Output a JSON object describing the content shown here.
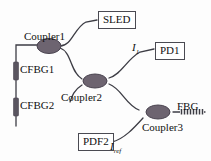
{
  "diagram": {
    "background_color": "#fdfdfd",
    "line_color": "#3d3d45",
    "coupler_fill": "#6d6470",
    "coupler_stroke": "#4a4450",
    "grating_color": "#5a5560"
  },
  "couplers": [
    {
      "id": "coupler1",
      "label": "Coupler1"
    },
    {
      "id": "coupler2",
      "label": "Coupler2"
    },
    {
      "id": "coupler3",
      "label": "Coupler3"
    }
  ],
  "gratings": [
    {
      "id": "cfbg1",
      "label": "CFBG1"
    },
    {
      "id": "cfbg2",
      "label": "CFBG2"
    },
    {
      "id": "fbg",
      "label": "FBG"
    }
  ],
  "devices": [
    {
      "id": "sled",
      "label": "SLED"
    },
    {
      "id": "pd1",
      "label": "PD1"
    },
    {
      "id": "pdf2",
      "label": "PDF2"
    }
  ],
  "signals": [
    {
      "id": "i1",
      "symbol": "I",
      "subscript": "1"
    },
    {
      "id": "iref",
      "symbol": "I",
      "subscript": "ref"
    }
  ]
}
